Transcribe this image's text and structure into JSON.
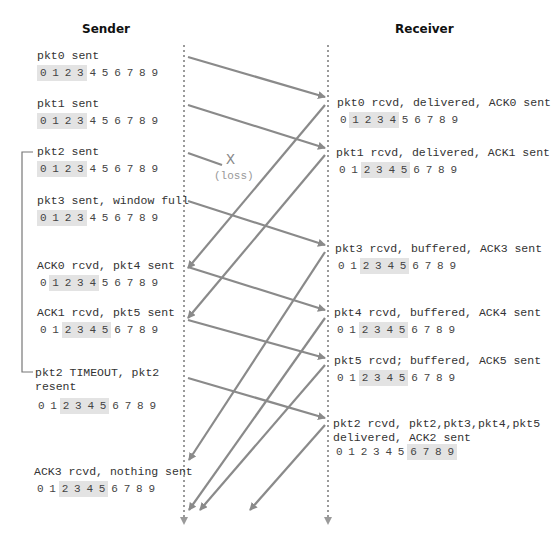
{
  "headers": {
    "sender": "Sender",
    "receiver": "Receiver"
  },
  "colors": {
    "arrow": "#8a8a8a",
    "timeline": "#9a9a9a",
    "window_highlight": "#e3e3e3",
    "text": "#333333"
  },
  "loss": {
    "mark": "X",
    "label": "(loss)"
  },
  "sequence_numbers": [
    "0",
    "1",
    "2",
    "3",
    "4",
    "5",
    "6",
    "7",
    "8",
    "9"
  ],
  "sender_events": [
    {
      "text": "pkt0 sent",
      "window": [
        0,
        1,
        2,
        3
      ]
    },
    {
      "text": "pkt1 sent",
      "window": [
        0,
        1,
        2,
        3
      ]
    },
    {
      "text": "pkt2 sent",
      "window": [
        0,
        1,
        2,
        3
      ]
    },
    {
      "text": "pkt3 sent, window full",
      "window": [
        0,
        1,
        2,
        3
      ]
    },
    {
      "text": "ACK0 rcvd, pkt4 sent",
      "window": [
        1,
        2,
        3,
        4
      ]
    },
    {
      "text": "ACK1 rcvd, pkt5 sent",
      "window": [
        2,
        3,
        4,
        5
      ]
    },
    {
      "text": "pkt2 TIMEOUT, pkt2\nresent",
      "window": [
        2,
        3,
        4,
        5
      ]
    },
    {
      "text": "ACK3 rcvd, nothing sent",
      "window": [
        2,
        3,
        4,
        5
      ]
    }
  ],
  "receiver_events": [
    {
      "text": "pkt0 rcvd, delivered, ACK0 sent",
      "window": [
        1,
        2,
        3,
        4
      ]
    },
    {
      "text": "pkt1 rcvd, delivered, ACK1 sent",
      "window": [
        2,
        3,
        4,
        5
      ]
    },
    {
      "text": "pkt3 rcvd, buffered, ACK3 sent",
      "window": [
        2,
        3,
        4,
        5
      ]
    },
    {
      "text": "pkt4 rcvd, buffered, ACK4 sent",
      "window": [
        2,
        3,
        4,
        5
      ]
    },
    {
      "text": "pkt5 rcvd; buffered, ACK5 sent",
      "window": [
        2,
        3,
        4,
        5
      ]
    },
    {
      "text": "pkt2 rcvd, pkt2,pkt3,pkt4,pkt5\ndelivered, ACK2 sent",
      "window": [
        6,
        7,
        8,
        9
      ]
    }
  ],
  "timeout_bracket": {
    "from_event": "pkt2 sent",
    "to_event": "pkt2 TIMEOUT, pkt2 resent"
  },
  "messages": [
    {
      "name": "pkt0",
      "dir": "sender-to-receiver",
      "x1": 188,
      "y1": 57,
      "x2": 325,
      "y2": 97
    },
    {
      "name": "pkt1",
      "dir": "sender-to-receiver",
      "x1": 188,
      "y1": 105,
      "x2": 325,
      "y2": 148
    },
    {
      "name": "pkt2-lost",
      "dir": "sender-to-receiver",
      "x1": 188,
      "y1": 153,
      "x2": 222,
      "y2": 165,
      "lost": true
    },
    {
      "name": "pkt3",
      "dir": "sender-to-receiver",
      "x1": 188,
      "y1": 201,
      "x2": 325,
      "y2": 245
    },
    {
      "name": "pkt4",
      "dir": "sender-to-receiver",
      "x1": 188,
      "y1": 267,
      "x2": 325,
      "y2": 310
    },
    {
      "name": "pkt5",
      "dir": "sender-to-receiver",
      "x1": 188,
      "y1": 320,
      "x2": 325,
      "y2": 358
    },
    {
      "name": "pkt2-resent",
      "dir": "sender-to-receiver",
      "x1": 188,
      "y1": 378,
      "x2": 325,
      "y2": 418
    },
    {
      "name": "ACK0",
      "dir": "receiver-to-sender",
      "x1": 325,
      "y1": 105,
      "x2": 188,
      "y2": 268
    },
    {
      "name": "ACK1",
      "dir": "receiver-to-sender",
      "x1": 325,
      "y1": 155,
      "x2": 188,
      "y2": 318
    },
    {
      "name": "ACK3",
      "dir": "receiver-to-sender",
      "x1": 325,
      "y1": 252,
      "x2": 189,
      "y2": 460
    },
    {
      "name": "ACK4",
      "dir": "receiver-to-sender",
      "x1": 325,
      "y1": 318,
      "x2": 189,
      "y2": 510
    },
    {
      "name": "ACK5",
      "dir": "receiver-to-sender",
      "x1": 325,
      "y1": 365,
      "x2": 200,
      "y2": 510
    },
    {
      "name": "ACK2",
      "dir": "receiver-to-sender",
      "x1": 325,
      "y1": 425,
      "x2": 250,
      "y2": 510
    }
  ]
}
